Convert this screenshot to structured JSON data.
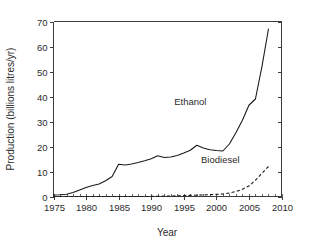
{
  "chart_data": {
    "type": "line",
    "title": "",
    "xlabel": "Year",
    "ylabel": "Production (billions litres/yr)",
    "xlim": [
      1975,
      2010
    ],
    "ylim": [
      0,
      70
    ],
    "xticks": [
      1975,
      1980,
      1985,
      1990,
      1995,
      2000,
      2005,
      2010
    ],
    "xtick_labels": [
      "1975",
      "1980",
      "1985",
      "1990",
      "1995",
      "2000",
      "2005",
      "2010"
    ],
    "x_minor_tick_step": 1,
    "yticks": [
      0,
      10,
      20,
      30,
      40,
      50,
      60,
      70
    ],
    "ytick_labels": [
      "0",
      "10",
      "20",
      "30",
      "40",
      "50",
      "60",
      "70"
    ],
    "grid": false,
    "legend": "inline-annotations",
    "frame": [
      "left",
      "top",
      "right"
    ],
    "line_color": "#1a1a1a",
    "background_color": "#ffffff",
    "x": [
      1975,
      1976,
      1977,
      1978,
      1979,
      1980,
      1981,
      1982,
      1983,
      1984,
      1985,
      1986,
      1987,
      1988,
      1989,
      1990,
      1991,
      1992,
      1993,
      1994,
      1995,
      1996,
      1997,
      1998,
      1999,
      2000,
      2001,
      2002,
      2003,
      2004,
      2005,
      2006,
      2007,
      2008
    ],
    "series": [
      {
        "name": "Ethanol",
        "style": "solid",
        "label_position": {
          "x": 1996.0,
          "y": 36.5
        },
        "values": [
          0.6,
          0.7,
          0.9,
          1.6,
          2.6,
          3.6,
          4.4,
          5.0,
          6.3,
          8.0,
          12.9,
          12.6,
          13.0,
          13.6,
          14.3,
          15.1,
          16.3,
          15.6,
          15.8,
          16.4,
          17.4,
          18.5,
          20.5,
          19.4,
          18.7,
          18.4,
          18.2,
          21.0,
          25.5,
          30.5,
          36.5,
          39.0,
          52.0,
          67.0
        ]
      },
      {
        "name": "Biodiesel",
        "style": "dashed",
        "label_position": {
          "x": 2000.6,
          "y": 13.5
        },
        "values": [
          0.0,
          0.0,
          0.0,
          0.0,
          0.0,
          0.0,
          0.0,
          0.0,
          0.0,
          0.0,
          0.0,
          0.0,
          0.0,
          0.0,
          0.0,
          0.05,
          0.1,
          0.15,
          0.2,
          0.25,
          0.35,
          0.45,
          0.55,
          0.65,
          0.75,
          0.85,
          1.0,
          1.4,
          2.0,
          2.9,
          4.2,
          6.5,
          9.3,
          12.0
        ]
      }
    ]
  }
}
